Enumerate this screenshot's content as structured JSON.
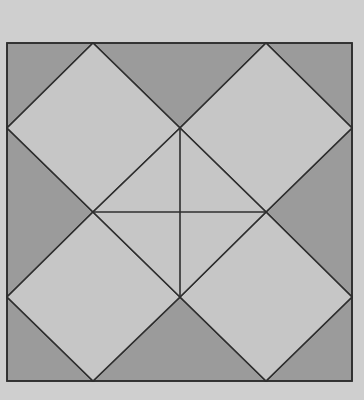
{
  "figure": {
    "width": 364,
    "height": 400,
    "colors": {
      "background": "#cfcfcf",
      "dark_fill": "#9b9b9b",
      "light_fill": "#c6c6c6",
      "stroke": "#2e2e2e"
    },
    "stroke_width": 1.6,
    "outer_square": {
      "x1": 7,
      "y1": 43,
      "x2": 352,
      "y2": 381
    },
    "dark_regions": [
      {
        "name": "corner-top-left",
        "points": [
          [
            7,
            43
          ],
          [
            93,
            43
          ],
          [
            7,
            128
          ]
        ]
      },
      {
        "name": "corner-top-right",
        "points": [
          [
            266,
            43
          ],
          [
            352,
            43
          ],
          [
            352,
            128
          ]
        ]
      },
      {
        "name": "corner-bottom-left",
        "points": [
          [
            7,
            297
          ],
          [
            93,
            381
          ],
          [
            7,
            381
          ]
        ]
      },
      {
        "name": "corner-bottom-right",
        "points": [
          [
            352,
            297
          ],
          [
            352,
            381
          ],
          [
            266,
            381
          ]
        ]
      },
      {
        "name": "triangle-top-middle",
        "points": [
          [
            93,
            43
          ],
          [
            266,
            43
          ],
          [
            180,
            128
          ]
        ]
      },
      {
        "name": "triangle-bottom-middle",
        "points": [
          [
            93,
            381
          ],
          [
            180,
            297
          ],
          [
            266,
            381
          ]
        ]
      },
      {
        "name": "triangle-left-middle",
        "points": [
          [
            7,
            128
          ],
          [
            93,
            212
          ],
          [
            7,
            297
          ]
        ]
      },
      {
        "name": "triangle-right-middle",
        "points": [
          [
            352,
            128
          ],
          [
            352,
            297
          ],
          [
            266,
            212
          ]
        ]
      }
    ],
    "light_regions": [
      {
        "name": "diamond-top-left",
        "points": [
          [
            93,
            43
          ],
          [
            180,
            128
          ],
          [
            93,
            212
          ],
          [
            7,
            128
          ]
        ]
      },
      {
        "name": "diamond-top-right",
        "points": [
          [
            266,
            43
          ],
          [
            352,
            128
          ],
          [
            266,
            212
          ],
          [
            180,
            128
          ]
        ]
      },
      {
        "name": "diamond-bottom-left",
        "points": [
          [
            93,
            212
          ],
          [
            180,
            297
          ],
          [
            93,
            381
          ],
          [
            7,
            297
          ]
        ]
      },
      {
        "name": "diamond-bottom-right",
        "points": [
          [
            266,
            212
          ],
          [
            352,
            297
          ],
          [
            266,
            381
          ],
          [
            180,
            297
          ]
        ]
      },
      {
        "name": "diamond-center",
        "points": [
          [
            180,
            128
          ],
          [
            266,
            212
          ],
          [
            180,
            297
          ],
          [
            93,
            212
          ]
        ]
      }
    ],
    "center_cross": {
      "vertical": {
        "x1": 180,
        "y1": 128,
        "x2": 180,
        "y2": 297
      },
      "horizontal": {
        "x1": 93,
        "y1": 212,
        "x2": 266,
        "y2": 212
      }
    }
  }
}
